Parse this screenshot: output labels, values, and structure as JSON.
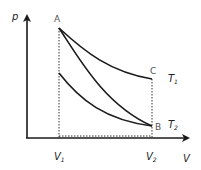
{
  "diagram": {
    "type": "p-V diagram",
    "axes": {
      "y_label": "p",
      "x_label": "V",
      "x_ticks": [
        {
          "main": "V",
          "sub": "1"
        },
        {
          "main": "V",
          "sub": "2"
        }
      ]
    },
    "points": {
      "A": "A",
      "B": "B",
      "C": "C"
    },
    "isotherms": [
      {
        "main": "T",
        "sub": "1"
      },
      {
        "main": "T",
        "sub": "2"
      }
    ],
    "colors": {
      "line": "#1a1a1a",
      "point_label": "#555555"
    }
  }
}
